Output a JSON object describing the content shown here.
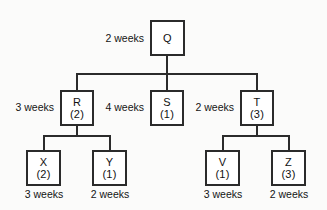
{
  "diagram": {
    "type": "hierarchy-tree",
    "colors": {
      "box_border": "#2b2b2b",
      "box_fill": "#ffffff",
      "edge": "#2b2b2b",
      "text": "#111111",
      "background": "#fbfbfa"
    },
    "nodes": [
      {
        "key": "Q",
        "id": "Q",
        "count": "",
        "level": 0,
        "duration": "2 weeks",
        "duration_position": "left"
      },
      {
        "key": "R",
        "id": "R",
        "count": "(2)",
        "level": 1,
        "duration": "3 weeks",
        "duration_position": "left"
      },
      {
        "key": "S",
        "id": "S",
        "count": "(1)",
        "level": 1,
        "duration": "4 weeks",
        "duration_position": "left"
      },
      {
        "key": "T",
        "id": "T",
        "count": "(3)",
        "level": 1,
        "duration": "2 weeks",
        "duration_position": "left"
      },
      {
        "key": "X",
        "id": "X",
        "count": "(2)",
        "level": 2,
        "duration": "3 weeks",
        "duration_position": "below"
      },
      {
        "key": "Y",
        "id": "Y",
        "count": "(1)",
        "level": 2,
        "duration": "2 weeks",
        "duration_position": "below"
      },
      {
        "key": "V",
        "id": "V",
        "count": "(1)",
        "level": 2,
        "duration": "3 weeks",
        "duration_position": "below"
      },
      {
        "key": "Z",
        "id": "Z",
        "count": "(3)",
        "level": 2,
        "duration": "2 weeks",
        "duration_position": "below"
      }
    ],
    "edges": [
      {
        "from": "Q",
        "to": "R"
      },
      {
        "from": "Q",
        "to": "S"
      },
      {
        "from": "Q",
        "to": "T"
      },
      {
        "from": "R",
        "to": "X"
      },
      {
        "from": "R",
        "to": "Y"
      },
      {
        "from": "T",
        "to": "V"
      },
      {
        "from": "T",
        "to": "Z"
      }
    ]
  }
}
